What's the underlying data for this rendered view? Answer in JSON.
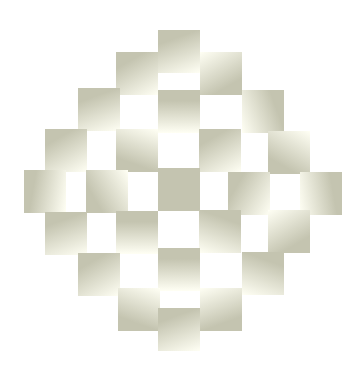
{
  "figure": {
    "colors": {
      "dark": "#c4c4b0",
      "light": "#fffff4",
      "background": "#ffffff"
    },
    "tiles": [
      {
        "x": 158,
        "y": 30,
        "angle": 160
      },
      {
        "x": 116,
        "y": 52,
        "angle": 150
      },
      {
        "x": 200,
        "y": 52,
        "angle": 330
      },
      {
        "x": 78,
        "y": 88,
        "angle": 160
      },
      {
        "x": 158,
        "y": 90,
        "angle": 180
      },
      {
        "x": 242,
        "y": 90,
        "angle": 250
      },
      {
        "x": 45,
        "y": 129,
        "angle": 150
      },
      {
        "x": 116,
        "y": 129,
        "angle": 20
      },
      {
        "x": 199,
        "y": 129,
        "angle": 150
      },
      {
        "x": 268,
        "y": 131,
        "angle": 30
      },
      {
        "x": 24,
        "y": 170,
        "angle": 100
      },
      {
        "x": 86,
        "y": 170,
        "angle": 60
      },
      {
        "x": 158,
        "y": 168,
        "angle": -1
      },
      {
        "x": 228,
        "y": 172,
        "angle": 120
      },
      {
        "x": 300,
        "y": 172,
        "angle": 260
      },
      {
        "x": 45,
        "y": 212,
        "angle": 160
      },
      {
        "x": 116,
        "y": 211,
        "angle": 180
      },
      {
        "x": 199,
        "y": 210,
        "angle": 200
      },
      {
        "x": 268,
        "y": 210,
        "angle": 330
      },
      {
        "x": 78,
        "y": 253,
        "angle": 150
      },
      {
        "x": 158,
        "y": 248,
        "angle": 180
      },
      {
        "x": 242,
        "y": 252,
        "angle": 200
      },
      {
        "x": 118,
        "y": 288,
        "angle": 20
      },
      {
        "x": 200,
        "y": 288,
        "angle": 340
      },
      {
        "x": 158,
        "y": 308,
        "angle": 160
      }
    ]
  }
}
